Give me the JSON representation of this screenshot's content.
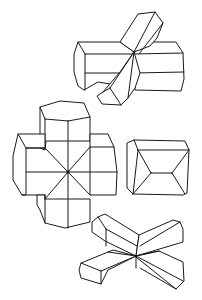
{
  "figure": {
    "background": "#ffffff",
    "stroke_color": "#1a1a1a",
    "crystals": [
      {
        "id": "top-twin",
        "form": "interpenetrant prismatic twin (inclined)"
      },
      {
        "id": "cross-twin",
        "form": "cruciform twin of hexagonal prisms"
      },
      {
        "id": "single-prism",
        "form": "single prismatic crystal with pyramidal terminations"
      },
      {
        "id": "x-twin",
        "form": "X-shaped penetration twin"
      }
    ]
  }
}
